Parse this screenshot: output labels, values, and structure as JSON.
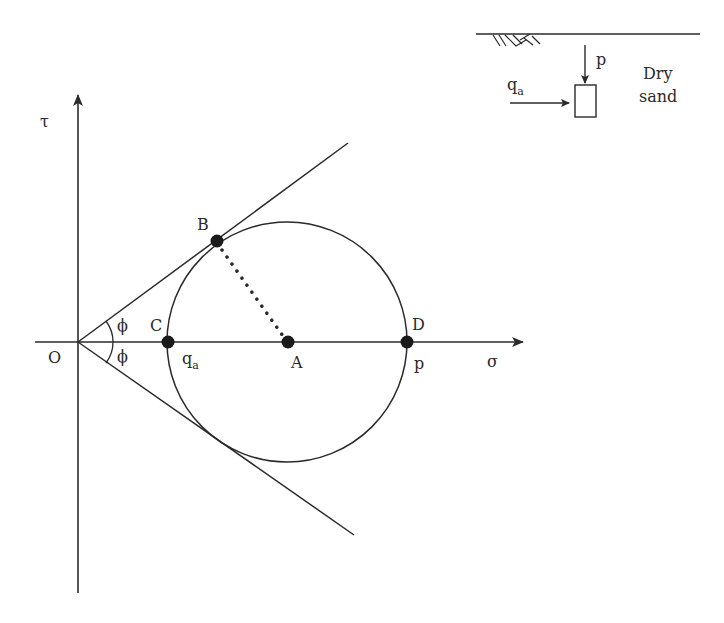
{
  "diagram": {
    "type": "Mohr circle with failure envelope",
    "axes": {
      "vertical_label": "τ",
      "horizontal_label": "σ",
      "origin_label": "O"
    },
    "angle_labels": {
      "upper": "ϕ",
      "lower": "ϕ"
    },
    "points": {
      "B": "B",
      "C": "C",
      "A": "A",
      "D": "D"
    },
    "point_values": {
      "C_value": "q",
      "C_value_sub": "a",
      "D_value": "p"
    },
    "inset": {
      "vertical_load_label": "p",
      "horizontal_load_label": "q",
      "horizontal_load_sub": "a",
      "soil_line1": "Dry",
      "soil_line2": "sand"
    },
    "colors": {
      "ink": "#2a2a2a",
      "background": "#ffffff"
    }
  }
}
